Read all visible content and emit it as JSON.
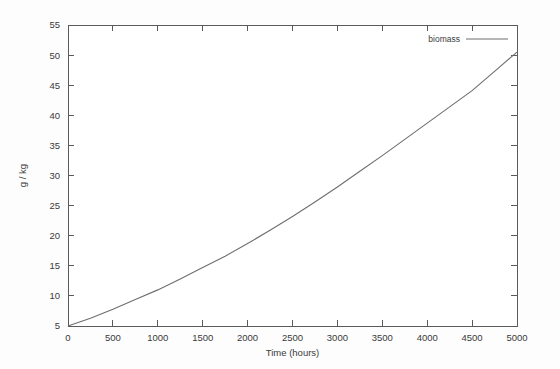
{
  "chart_data": {
    "type": "line",
    "title": "",
    "xlabel": "Time (hours)",
    "ylabel": "g / kg",
    "xlim": [
      0,
      5000
    ],
    "ylim": [
      5,
      55
    ],
    "grid": false,
    "legend_position": "top-right",
    "xticks": [
      0,
      500,
      1000,
      1500,
      2000,
      2500,
      3000,
      3500,
      4000,
      4500,
      5000
    ],
    "xtick_labels": [
      "0",
      "500",
      "1000",
      "1500",
      "2000",
      "2500",
      "3000",
      "3500",
      "4000",
      "4500",
      "5000"
    ],
    "yticks": [
      5,
      10,
      15,
      20,
      25,
      30,
      35,
      40,
      45,
      50,
      55
    ],
    "ytick_labels": [
      "5",
      "10",
      "15",
      "20",
      "25",
      "30",
      "35",
      "40",
      "45",
      "50",
      "55"
    ],
    "series": [
      {
        "name": "biomass",
        "color": "#6e6e6e",
        "x": [
          0,
          250,
          500,
          750,
          1000,
          1250,
          1500,
          1750,
          2000,
          2250,
          2500,
          2750,
          3000,
          3250,
          3500,
          3750,
          4000,
          4250,
          4500,
          4750,
          5000
        ],
        "values": [
          5.0,
          6.3,
          7.8,
          9.4,
          11.0,
          12.8,
          14.7,
          16.6,
          18.7,
          20.9,
          23.2,
          25.6,
          28.1,
          30.7,
          33.3,
          36.0,
          38.7,
          41.4,
          44.1,
          47.3,
          50.5
        ]
      }
    ]
  },
  "legend": {
    "entries": [
      {
        "label": "biomass"
      }
    ]
  },
  "axes": {
    "x_title": "Time (hours)",
    "y_title": "g / kg"
  }
}
